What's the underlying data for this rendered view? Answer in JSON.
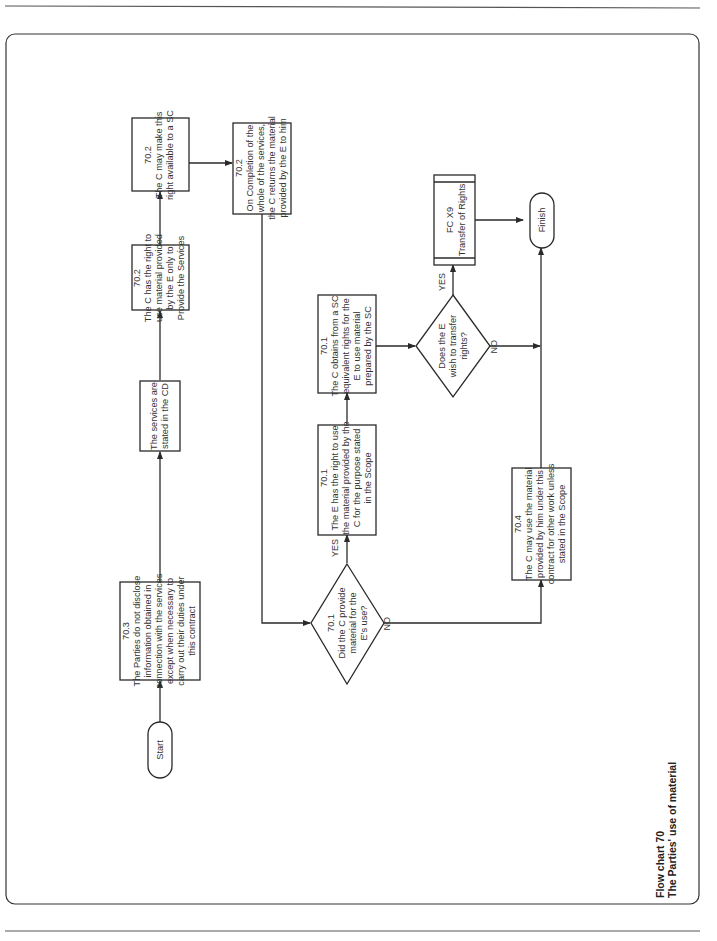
{
  "caption": {
    "line1": "Flow chart 70",
    "line2": "The Parties' use of material"
  },
  "nodes": {
    "start": {
      "label": "Start"
    },
    "finish": {
      "label": "Finish"
    },
    "n70_3": {
      "ref": "70.3",
      "lines": [
        "The Parties do not disclose",
        "information obtained in",
        "connection with the services",
        "except when necessary to",
        "carry out their duties under",
        "this contract"
      ]
    },
    "services": {
      "lines": [
        "The services are",
        "stated in the CD"
      ]
    },
    "n70_2a": {
      "ref": "70.2",
      "lines": [
        "The C has the right to",
        "use material provided",
        "by the E only to",
        "Provide the Services"
      ]
    },
    "n70_2b": {
      "ref": "70.2",
      "lines": [
        "The C may make this",
        "right available to a SC"
      ]
    },
    "n70_2c": {
      "ref": "70.2",
      "lines": [
        "On Completion of the",
        "whole of the services,",
        "the C returns the material",
        "provided by the E to him"
      ]
    },
    "d70_1": {
      "ref": "70.1",
      "lines": [
        "Did the C provide",
        "material for the",
        "E's use?"
      ]
    },
    "n70_1a": {
      "ref": "70.1",
      "lines": [
        "The E has the right to use",
        "the material provided by the",
        "C for the purpose stated",
        "in the Scope"
      ]
    },
    "n70_1b": {
      "ref": "70.1",
      "lines": [
        "The C obtains from a SC",
        "equivalent rights for the",
        "E to use material",
        "prepared by the SC"
      ]
    },
    "d_transfer": {
      "lines": [
        "Does the E",
        "wish to transfer",
        "rights?"
      ]
    },
    "fcx9": {
      "lines": [
        "FC X9",
        "Transfer of Rights"
      ]
    },
    "n70_4": {
      "ref": "70.4",
      "lines": [
        "The C may use the material",
        "provided by him under this",
        "contract for other work unless",
        "stated in the Scope"
      ]
    }
  },
  "edge_labels": {
    "yes1": "YES",
    "no1": "NO",
    "yes2": "YES",
    "no2": "NO"
  }
}
